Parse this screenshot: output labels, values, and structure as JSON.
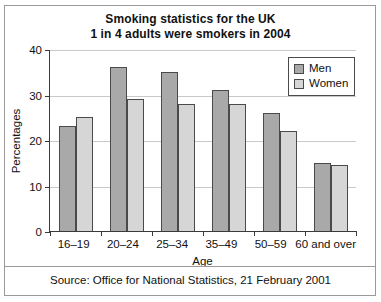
{
  "chart_data": {
    "type": "bar",
    "title": "Smoking statistics for the UK",
    "subtitle": "1 in 4 adults were smokers in 2004",
    "xlabel": "Age",
    "ylabel": "Percentages",
    "categories": [
      "16–19",
      "20–24",
      "25–34",
      "35–49",
      "50–59",
      "60 and over"
    ],
    "series": [
      {
        "name": "Men",
        "values": [
          23,
          36,
          35,
          31,
          26,
          15
        ],
        "color": "#a9a9a9"
      },
      {
        "name": "Women",
        "values": [
          25,
          29,
          28,
          28,
          22,
          14.5
        ],
        "color": "#d6d6d6"
      }
    ],
    "ylim": [
      0,
      40
    ],
    "yticks": [
      0,
      10,
      20,
      30,
      40
    ],
    "ytick_labels": [
      "0",
      "10",
      "20",
      "30",
      "40"
    ],
    "grid": true,
    "legend_position": "top-right"
  },
  "source": {
    "text": "Source: Office for National Statistics, 21 February 2001"
  }
}
